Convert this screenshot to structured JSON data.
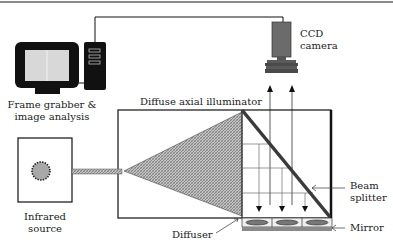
{
  "figure": {
    "type": "schematic"
  },
  "labels": {
    "ccd_camera": [
      "CCD",
      "camera"
    ],
    "frame_grabber": [
      "Frame grabber &",
      "image analysis"
    ],
    "diffuse_axial_illuminator": "Diffuse axial illuminator",
    "infrared_source": [
      "Infrared",
      "source"
    ],
    "diffuser": "Diffuser",
    "beam_splitter": [
      "Beam",
      "splitter"
    ],
    "mirror": "Mirror"
  },
  "colors": {
    "line": "#111111",
    "camera_body": "#6b6b6b",
    "hatch_fill": "#9a9a9a",
    "monitor_frame": "#111111",
    "screen": "#d8d8d8",
    "top_rule": "#8a8a8a"
  }
}
